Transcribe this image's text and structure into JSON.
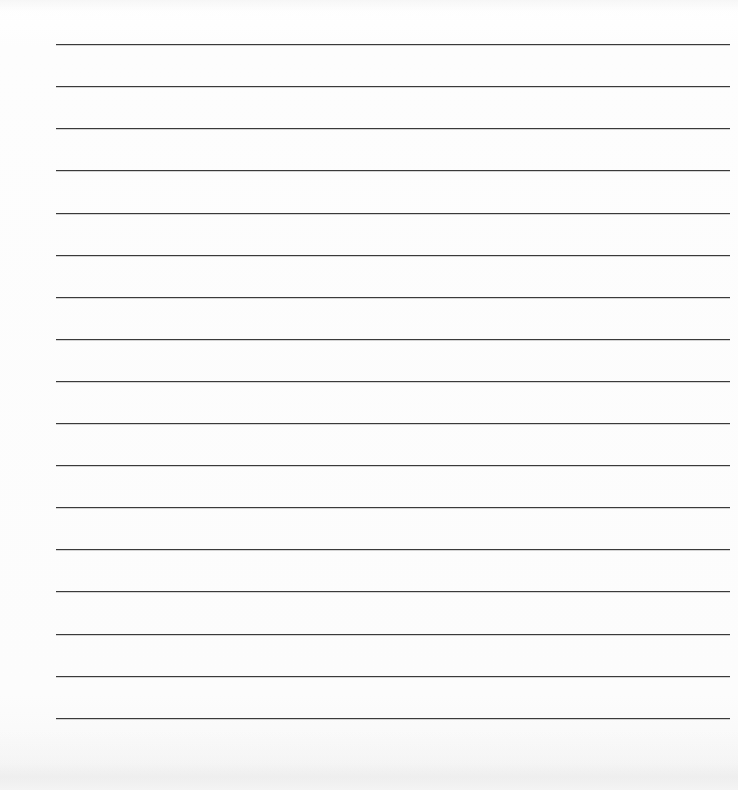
{
  "document": {
    "kind": "ruled-paper-scan",
    "title": "Blank Ruled Writing Paper",
    "width_px": 738,
    "height_px": 790,
    "background_color": "#fdfdfd",
    "has_text_content": false,
    "visible_text": ""
  },
  "ruling": {
    "line_count": 17,
    "line_color": "#3a3a3a",
    "line_thickness_px": 1.5,
    "first_line_y_px": 44,
    "line_spacing_px": 42.1,
    "line_start_x_px": 56,
    "line_end_x_px": 730,
    "orientation": "horizontal",
    "margin_left_px": 56,
    "margin_right_px": 8,
    "margin_top_px": 44,
    "margin_bottom_px": 72,
    "lines": [
      {
        "index": 1,
        "y": 44,
        "x1": 56,
        "x2": 730
      },
      {
        "index": 2,
        "y": 86,
        "x1": 56,
        "x2": 730
      },
      {
        "index": 3,
        "y": 128,
        "x1": 56,
        "x2": 730
      },
      {
        "index": 4,
        "y": 170,
        "x1": 56,
        "x2": 730
      },
      {
        "index": 5,
        "y": 213,
        "x1": 56,
        "x2": 730
      },
      {
        "index": 6,
        "y": 255,
        "x1": 56,
        "x2": 730
      },
      {
        "index": 7,
        "y": 297,
        "x1": 56,
        "x2": 730
      },
      {
        "index": 8,
        "y": 339,
        "x1": 56,
        "x2": 730
      },
      {
        "index": 9,
        "y": 381,
        "x1": 56,
        "x2": 730
      },
      {
        "index": 10,
        "y": 423,
        "x1": 56,
        "x2": 730
      },
      {
        "index": 11,
        "y": 465,
        "x1": 56,
        "x2": 730
      },
      {
        "index": 12,
        "y": 507,
        "x1": 56,
        "x2": 730
      },
      {
        "index": 13,
        "y": 549,
        "x1": 56,
        "x2": 730
      },
      {
        "index": 14,
        "y": 591,
        "x1": 56,
        "x2": 730
      },
      {
        "index": 15,
        "y": 634,
        "x1": 56,
        "x2": 730
      },
      {
        "index": 16,
        "y": 676,
        "x1": 56,
        "x2": 730
      },
      {
        "index": 17,
        "y": 718,
        "x1": 56,
        "x2": 730
      }
    ]
  }
}
